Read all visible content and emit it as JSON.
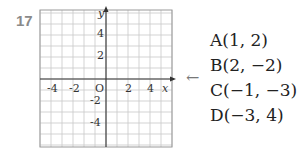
{
  "problem": {
    "number": "17"
  },
  "chart_data": {
    "type": "scatter",
    "title": "",
    "xlabel": "x",
    "ylabel": "y",
    "xlim": [
      -6,
      6
    ],
    "ylim": [
      -6,
      6
    ],
    "grid": true,
    "x_ticks": [
      "-4",
      "-2",
      "2",
      "4"
    ],
    "y_ticks": [
      "4",
      "2",
      "-2",
      "-4"
    ],
    "origin_label": "O",
    "points": []
  },
  "arrow": "←",
  "answers": [
    {
      "label": "A(1, 2)"
    },
    {
      "label": "B(2, −2)"
    },
    {
      "label": "C(−1, −3)"
    },
    {
      "label": "D(−3, 4)"
    }
  ]
}
